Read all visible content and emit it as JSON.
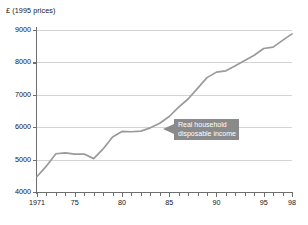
{
  "chart_data": {
    "type": "line",
    "title": "",
    "subtitle": "",
    "xlabel": "",
    "ylabel": "£ (1995 prices)",
    "ylim": [
      4000,
      9000
    ],
    "xlim": [
      1971,
      1998
    ],
    "grid": true,
    "legend_position": "none",
    "y_ticks": [
      9000,
      8000,
      7000,
      6000,
      5000,
      4000
    ],
    "y_tick_labels": [
      "9000",
      "8000",
      "7000",
      "6000",
      "5000",
      "4000"
    ],
    "x_ticks": [
      1971,
      1975,
      1980,
      1985,
      1990,
      1995,
      1998
    ],
    "x_tick_labels": [
      "1971",
      "75",
      "80",
      "85",
      "90",
      "95",
      "98"
    ],
    "x_minor_tick_interval": 1,
    "line_color": "#9a9a9a",
    "series": [
      {
        "name": "Real household disposable income",
        "x": [
          1971,
          1972,
          1973,
          1974,
          1975,
          1976,
          1977,
          1978,
          1979,
          1980,
          1981,
          1982,
          1983,
          1984,
          1985,
          1986,
          1987,
          1988,
          1989,
          1990,
          1991,
          1992,
          1993,
          1994,
          1995,
          1996,
          1997,
          1998
        ],
        "values": [
          4480,
          4800,
          5180,
          5210,
          5170,
          5170,
          5030,
          5330,
          5700,
          5870,
          5860,
          5880,
          5980,
          6120,
          6330,
          6620,
          6870,
          7200,
          7530,
          7700,
          7740,
          7900,
          8060,
          8220,
          8430,
          8470,
          8680,
          8880
        ]
      }
    ],
    "annotations": [
      {
        "name": "series-callout",
        "line1": "Real household",
        "line2": "disposable income",
        "background_color": "#8a8a8a",
        "text_color": "#ffffff",
        "points_to_year": 1986
      }
    ]
  }
}
